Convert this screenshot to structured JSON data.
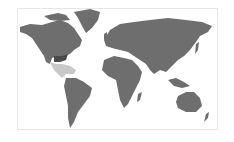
{
  "map": {
    "type": "world-choropleth",
    "base_color": "#6e6e6e",
    "background": "#ffffff",
    "highlights": [
      {
        "region": "Mexico / Central America / Caribbean",
        "color": "#c8c8c8"
      },
      {
        "region": "Southeastern United States",
        "color": "#4a4a4a"
      }
    ]
  }
}
